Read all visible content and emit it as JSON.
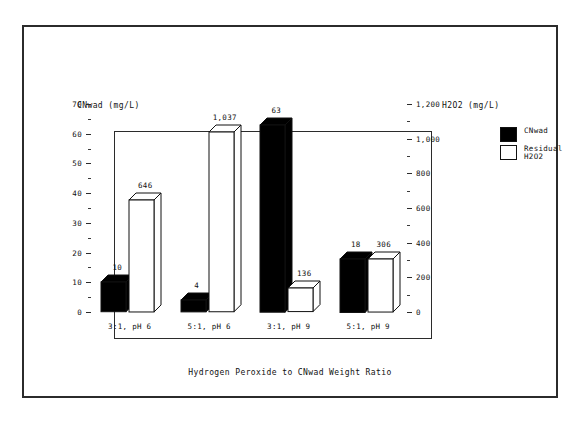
{
  "chart_data": {
    "type": "bar",
    "title": "",
    "subtitle": "",
    "xlabel": "Hydrogen Peroxide to CNwad Weight Ratio",
    "categories": [
      "3:1, pH 6",
      "5:1, pH 6",
      "3:1, pH 9",
      "5:1, pH 9"
    ],
    "series": [
      {
        "name": "CNwad",
        "axis": "left",
        "unit": "mg/L",
        "color": "#000000",
        "fill": "solid",
        "values": [
          10,
          4,
          63,
          18
        ],
        "labels": [
          "10",
          "4",
          "63",
          "18"
        ]
      },
      {
        "name": "Residual H2O2",
        "axis": "right",
        "unit": "mg/L",
        "color": "#ffffff",
        "fill": "open",
        "values": [
          646,
          1037,
          136,
          306
        ],
        "labels": [
          "646",
          "1,037",
          "136",
          "306"
        ]
      }
    ],
    "left_axis": {
      "label": "CNwad (mg/L)",
      "ylim": [
        0,
        70
      ],
      "major_step": 10,
      "minor_step": 5,
      "ticks": [
        0,
        10,
        20,
        30,
        40,
        50,
        60,
        70
      ],
      "tick_labels": [
        "0",
        "10",
        "20",
        "30",
        "40",
        "50",
        "60",
        "70"
      ]
    },
    "right_axis": {
      "label": "H2O2 (mg/L)",
      "ylim": [
        0,
        1200
      ],
      "major_step": 200,
      "minor_step": 100,
      "ticks": [
        0,
        200,
        400,
        600,
        800,
        1000,
        1200
      ],
      "tick_labels": [
        "0",
        "200",
        "400",
        "600",
        "800",
        "1,000",
        "1,200"
      ]
    },
    "legend": {
      "position": "top-right-outside",
      "entries": [
        {
          "label": "CNwad",
          "style": "dark"
        },
        {
          "label": "Residual\nH2O2",
          "style": "light"
        }
      ]
    },
    "grid": false,
    "style": "3d-bars-monochrome"
  }
}
